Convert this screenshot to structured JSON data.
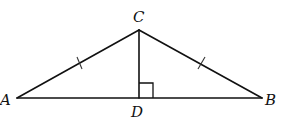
{
  "figure": {
    "type": "geometry-diagram",
    "colors": {
      "stroke": "#111111",
      "background": "#ffffff"
    }
  },
  "points": {
    "A": {
      "label": "A"
    },
    "B": {
      "label": "B"
    },
    "C": {
      "label": "C"
    },
    "D": {
      "label": "D"
    }
  },
  "segments": [
    {
      "name": "AC",
      "from": "A",
      "to": "C",
      "tick_marks": 1
    },
    {
      "name": "BC",
      "from": "B",
      "to": "C",
      "tick_marks": 1
    },
    {
      "name": "AB",
      "from": "A",
      "to": "B",
      "tick_marks": 0
    },
    {
      "name": "CD",
      "from": "C",
      "to": "D",
      "tick_marks": 0
    }
  ],
  "annotations": {
    "congruent_sides": [
      "AC",
      "BC"
    ],
    "right_angle_at": "D",
    "altitude": "CD"
  }
}
